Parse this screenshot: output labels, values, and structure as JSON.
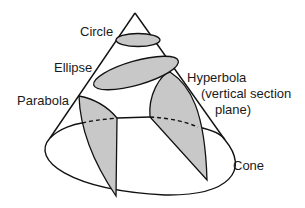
{
  "diagram": {
    "labels": {
      "circle": "Circle",
      "ellipse": "Ellipse",
      "parabola": "Parabola",
      "hyperbola_line1": "Hyperbola",
      "hyperbola_line2": "(vertical section",
      "hyperbola_line3": "plane)",
      "cone": "Cone"
    },
    "colors": {
      "section_fill": "#c8c8c8",
      "stroke": "#111111",
      "text": "#1a1a1a",
      "background": "#ffffff"
    }
  }
}
